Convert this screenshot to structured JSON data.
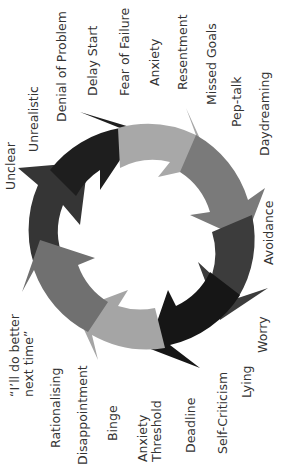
{
  "diagram": {
    "orientation": "rotated -90deg",
    "ring": {
      "center": [
        141,
        237
      ],
      "outer_radius": 112,
      "inner_radius": 72,
      "segments": [
        {
          "name": "segment-black-top",
          "color": "#1e1e1e"
        },
        {
          "name": "segment-lightgray-top",
          "color": "#a8a8a8"
        },
        {
          "name": "segment-gray-right",
          "color": "#7a7a7a"
        },
        {
          "name": "segment-darkgray-right",
          "color": "#3c3c3c"
        },
        {
          "name": "segment-black-bottom",
          "color": "#161616"
        },
        {
          "name": "segment-lightgray-bottom",
          "color": "#a5a5a5"
        },
        {
          "name": "segment-gray-left",
          "color": "#707070"
        },
        {
          "name": "segment-darkgray-left",
          "color": "#353535"
        }
      ]
    },
    "labels": {
      "unclear": "Unclear",
      "unrealistic": "Unrealistic",
      "denial": "Denial of Problem",
      "delay_start": "Delay Start",
      "fear_failure": "Fear of Failure",
      "anxiety": "Anxiety",
      "resentment": "Resentment",
      "missed_goals": "Missed Goals",
      "pep_talk": "Pep-talk",
      "daydreaming": "Daydreaming",
      "avoidance": "Avoidance",
      "worry": "Worry",
      "lying": "Lying",
      "self_criticism": "Self-Criticism",
      "deadline": "Deadline",
      "anxiety_threshold": "Anxiety\nThreshold",
      "binge": "Binge",
      "disappointment": "Disappointment",
      "rationalising": "Rationalising",
      "do_better": "“I’ll do better\nnext time”"
    }
  }
}
